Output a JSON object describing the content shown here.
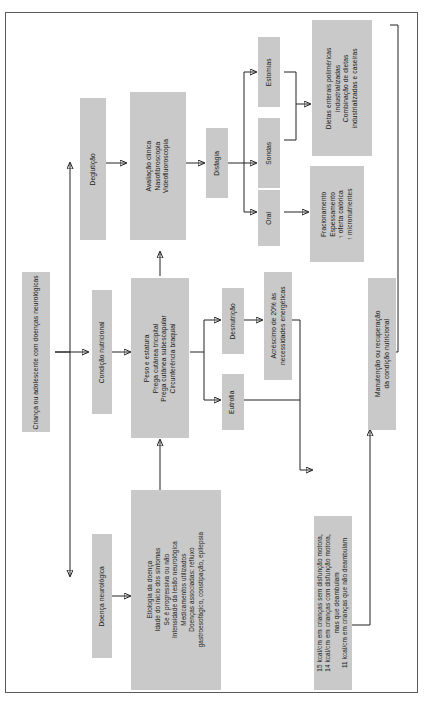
{
  "diagram": {
    "box_fill": "#c9c9c9",
    "border_color": "#5a5a5a",
    "text_color": "#1a1a1a"
  },
  "nodes": {
    "root": "Criança ou adolescente com doenças neurológicas",
    "condicao_nutricional": "Condição nutricional",
    "doenca_neurologica": "Doença neurológica",
    "degluticao": "Deglutição",
    "avaliacao_l1": "Avaliação clínica",
    "avaliacao_l2": "Nasofibroscopia",
    "avaliacao_l3": "Videofluoroscopia",
    "disfagia": "Disfagia",
    "estomias": "Estomias",
    "sondas": "Sondas",
    "oral": "Oral",
    "dietas_l1": "Dietas enterais poliméricas",
    "dietas_l2": "industrializadas",
    "dietas_l3": "Combinação de dietas",
    "dietas_l4": "industrializadas e caseiras",
    "fracionamento_l1": "Fracionamento",
    "fracionamento_l2": "Espessamento",
    "fracionamento_l3": "↑ oferta calórica",
    "fracionamento_l4": "↑ micronutrientes",
    "antropometria_l1": "Peso e estatura",
    "antropometria_l2": "Prega cutânea tricipital",
    "antropometria_l3": "Prega cutânea subescapular",
    "antropometria_l4": "Circunferência braquial",
    "desnutricao": "Desnutrição",
    "eutrofia": "Eutrofia",
    "acrescimo_l1": "Acréscimo de 20% às",
    "acrescimo_l2": "necessidades energéticas",
    "etiologia_l1": "Etiologia da doença",
    "etiologia_l2": "Idade do início dos sintomas",
    "etiologia_l3": "Se é progressiva ou não",
    "etiologia_l4": "Intensidade da lesão neurológica",
    "etiologia_l5": "Medicamentos utilizados",
    "etiologia_l6": "Doenças associadas: refluxo",
    "etiologia_l7": "gastroesofágico, constipação, epilepsia",
    "kcal_l1": "15 kcal/cm em crianças sem disfunção motora,",
    "kcal_l2": "14 kcal/cm em crianças com disfunção motora,",
    "kcal_l3": "mas que deambulam",
    "kcal_l4": "11 kcal/cm em crianças que não deambulam",
    "manutencao_l1": "Manutenção ou recuperação",
    "manutencao_l2": "da condição nutricional"
  }
}
